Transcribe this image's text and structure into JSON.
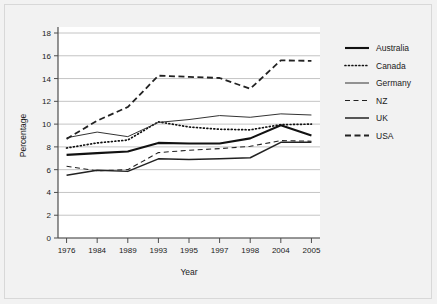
{
  "chart_data": {
    "type": "line",
    "title": "",
    "xlabel": "Year",
    "ylabel": "Percentage",
    "categories": [
      "1976",
      "1984",
      "1989",
      "1993",
      "1995",
      "1997",
      "1998",
      "2004",
      "2005"
    ],
    "ylim": [
      0,
      18
    ],
    "ytick_step": 2,
    "yticks": [
      "0",
      "2",
      "4",
      "6",
      "8",
      "10",
      "12",
      "14",
      "16",
      "18"
    ],
    "grid": "horizontal",
    "legend_position": "right",
    "plot_background": "#ffffff",
    "figure_background": "#f2f2f2",
    "gridline_color": "#b5b5b5",
    "axis_color": "#4d4d4d",
    "series": [
      {
        "name": "Australia",
        "style": "solid",
        "width": 2.1,
        "color": "#111111",
        "values": [
          7.3,
          7.45,
          7.6,
          8.35,
          8.3,
          8.3,
          8.75,
          9.9,
          9.0
        ]
      },
      {
        "name": "Canada",
        "style": "dotted",
        "width": 1.7,
        "color": "#111111",
        "values": [
          7.9,
          8.35,
          8.6,
          10.2,
          9.75,
          9.55,
          9.5,
          9.95,
          10.0
        ]
      },
      {
        "name": "Germany",
        "style": "solid",
        "width": 1.0,
        "color": "#333333",
        "values": [
          8.8,
          9.3,
          8.9,
          10.15,
          10.4,
          10.75,
          10.6,
          10.9,
          10.8
        ]
      },
      {
        "name": "NZ",
        "style": "dashed-thin",
        "width": 1.1,
        "color": "#222222",
        "values": [
          6.3,
          5.9,
          6.0,
          7.5,
          7.7,
          7.85,
          8.05,
          8.55,
          8.5
        ]
      },
      {
        "name": "UK",
        "style": "solid",
        "width": 1.5,
        "color": "#222222",
        "values": [
          5.5,
          5.95,
          5.85,
          6.95,
          6.9,
          6.95,
          7.05,
          8.4,
          8.4
        ]
      },
      {
        "name": "USA",
        "style": "dashed",
        "width": 1.8,
        "color": "#222222",
        "values": [
          8.7,
          10.3,
          11.5,
          14.25,
          14.15,
          14.05,
          13.1,
          15.6,
          15.55
        ]
      }
    ]
  }
}
